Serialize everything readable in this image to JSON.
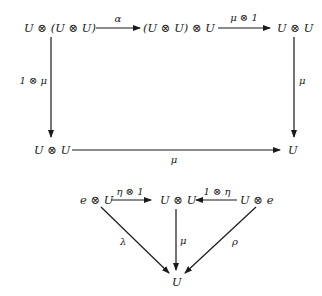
{
  "diagram": {
    "pentagon": {
      "nodes": {
        "top_left": "U ⊗ (U ⊗ U)",
        "top_mid": "(U ⊗ U) ⊗ U",
        "top_right": "U ⊗ U",
        "bottom_left": "U ⊗ U",
        "bottom_right": "U"
      },
      "arrows": {
        "alpha": "α",
        "mu_tensor_one": "μ ⊗ 1",
        "one_tensor_mu": "1 ⊗ μ",
        "right_mu": "μ",
        "bottom_mu": "μ"
      }
    },
    "triangle": {
      "nodes": {
        "left": "e ⊗ U",
        "center": "U ⊗ U",
        "right": "U ⊗ e",
        "bottom": "U"
      },
      "arrows": {
        "eta_tensor_one": "η ⊗ 1",
        "one_tensor_eta": "1 ⊗ η",
        "lambda": "λ",
        "mu": "μ",
        "rho": "ρ"
      }
    }
  }
}
